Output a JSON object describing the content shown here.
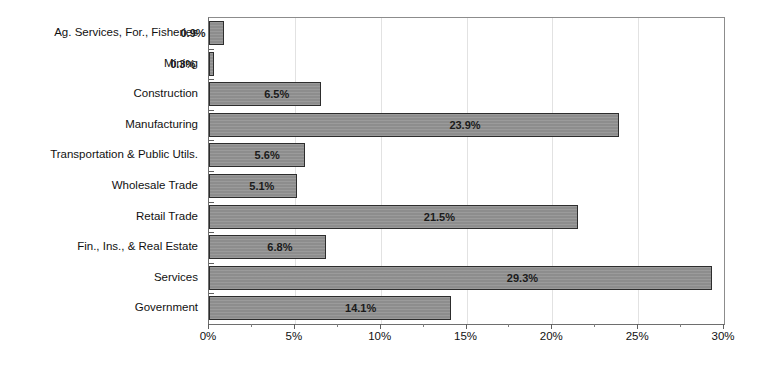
{
  "chart_data": {
    "type": "bar",
    "orientation": "horizontal",
    "title": "",
    "subtitle": "",
    "xlabel": "",
    "ylabel": "",
    "xlim": [
      0,
      30
    ],
    "xtick_labels": [
      "0%",
      "5%",
      "10%",
      "15%",
      "20%",
      "25%",
      "30%"
    ],
    "xtick_values": [
      0,
      5,
      10,
      15,
      20,
      25,
      30
    ],
    "minor_tick_values": [
      2.5,
      7.5,
      12.5,
      17.5,
      22.5,
      27.5
    ],
    "grid": "vertical-major",
    "legend": "none",
    "categories": [
      "Ag. Services, For., Fisheries",
      "Mining",
      "Construction",
      "Manufacturing",
      "Transportation & Public Utils.",
      "Wholesale Trade",
      "Retail Trade",
      "Fin., Ins., & Real Estate",
      "Services",
      "Government"
    ],
    "values": [
      0.9,
      0.3,
      6.5,
      23.9,
      5.6,
      5.1,
      21.5,
      6.8,
      29.3,
      14.1
    ],
    "data_labels": [
      "0.9%",
      "0.3%",
      "6.5%",
      "23.9%",
      "5.6%",
      "5.1%",
      "21.5%",
      "6.8%",
      "29.3%",
      "14.1%"
    ],
    "colors": {
      "bar_fill": "#8d8d8d",
      "bar_border": "#2d2d2d",
      "plot_border": "#8c8c8c",
      "gridline": "#e2e2e2",
      "text": "#111111",
      "background": "#ffffff"
    }
  }
}
